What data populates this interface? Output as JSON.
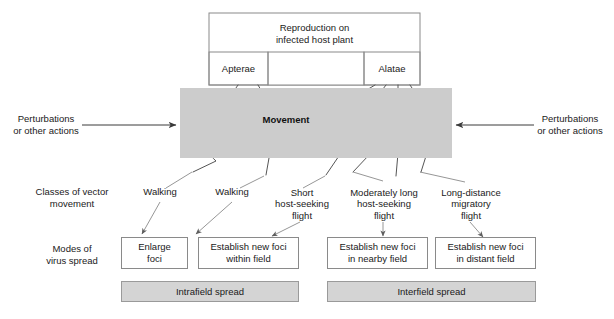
{
  "diagram": {
    "title_box": {
      "label": "Reproduction on\ninfected host plant"
    },
    "morph_boxes": [
      {
        "label": "Apterae"
      },
      {
        "label": "Alatae"
      }
    ],
    "movement_band": {
      "label": "Movement",
      "fill": "#cccccc"
    },
    "perturbations": [
      {
        "label": "Perturbations\nor other actions",
        "side": "left"
      },
      {
        "label": "Perturbations\nor other actions",
        "side": "right"
      }
    ],
    "row_labels": [
      {
        "label": "Classes of vector\nmovement"
      },
      {
        "label": "Modes of\nvirus spread"
      }
    ],
    "vector_movement_classes": [
      {
        "label": "Walking"
      },
      {
        "label": "Walking"
      },
      {
        "label": "Short\nhost-seeking\nflight"
      },
      {
        "label": "Moderately long\nhost-seeking\nflight"
      },
      {
        "label": "Long-distance\nmigratory\nflight"
      }
    ],
    "virus_spread_modes": [
      {
        "label": "Enlarge\nfoci"
      },
      {
        "label": "Establish new foci\nwithin field"
      },
      {
        "label": "Establish new foci\nin nearby field"
      },
      {
        "label": "Establish new foci\nin distant field"
      }
    ],
    "spread_scales": [
      {
        "label": "Intrafield spread"
      },
      {
        "label": "Interfield spread"
      }
    ],
    "colors": {
      "band_fill": "#cccccc",
      "bar_fill": "#d4d4d4",
      "box_stroke": "#8a8a8a",
      "line": "#6e6e6e",
      "text": "#1a1a1a"
    }
  }
}
